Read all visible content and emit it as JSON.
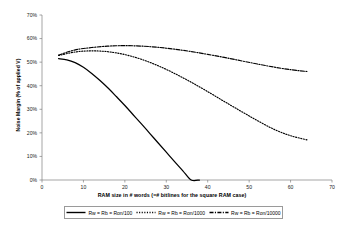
{
  "chart_data": {
    "type": "line",
    "title": "",
    "xlabel": "RAM size in # words (=# bitlines for the square RAM case)",
    "ylabel": "Noise Margin (% of applied V)",
    "xlim": [
      0,
      70
    ],
    "ylim": [
      0,
      70
    ],
    "xticks": [
      0,
      10,
      20,
      30,
      40,
      50,
      60,
      70
    ],
    "xtick_labels": [
      "0",
      "10",
      "20",
      "30",
      "40",
      "50",
      "60",
      "70"
    ],
    "yticks": [
      0,
      10,
      20,
      30,
      40,
      50,
      60,
      70
    ],
    "ytick_labels": [
      "0%",
      "10%",
      "20%",
      "30%",
      "40%",
      "50%",
      "60%",
      "70%"
    ],
    "grid": false,
    "legend_position": "bottom",
    "series": [
      {
        "name": "Rw = Rb = Ron/100",
        "style": "solid",
        "color": "#000000",
        "x": [
          4,
          6,
          8,
          10,
          12,
          14,
          16,
          18,
          20,
          22,
          24,
          26,
          28,
          30,
          32,
          34,
          36,
          38
        ],
        "y": [
          51.5,
          51.0,
          49.8,
          47.8,
          45.2,
          42.2,
          38.9,
          35.3,
          31.6,
          27.7,
          23.8,
          19.8,
          15.8,
          11.8,
          7.8,
          3.9,
          0.0,
          0.0
        ]
      },
      {
        "name": "Rw = Rb = Ron/1000",
        "style": "dotted",
        "color": "#000000",
        "x": [
          4,
          8,
          12,
          16,
          20,
          24,
          28,
          32,
          36,
          40,
          44,
          48,
          52,
          56,
          60,
          64
        ],
        "y": [
          52.8,
          54.3,
          54.8,
          54.4,
          53.2,
          51.2,
          48.5,
          45.2,
          41.5,
          37.5,
          33.3,
          29.2,
          25.2,
          21.5,
          18.8,
          17.0
        ]
      },
      {
        "name": "Rw = Rb = Ron/10000",
        "style": "dashdot",
        "color": "#000000",
        "x": [
          4,
          8,
          12,
          16,
          20,
          24,
          28,
          32,
          36,
          40,
          44,
          48,
          52,
          56,
          60,
          64
        ],
        "y": [
          53.0,
          55.2,
          56.2,
          56.8,
          57.0,
          56.8,
          56.3,
          55.5,
          54.5,
          53.3,
          52.0,
          50.6,
          49.2,
          47.9,
          46.8,
          46.0
        ]
      }
    ]
  },
  "axes": {
    "y_title": "Noise Margin (% of applied V)",
    "x_title": "RAM size in # words (=# bitlines for the square RAM case)",
    "y_labels": [
      "70%",
      "60%",
      "50%",
      "40%",
      "30%",
      "20%",
      "10%",
      "0%"
    ],
    "x_labels": [
      "0",
      "10",
      "20",
      "30",
      "40",
      "50",
      "60",
      "70"
    ]
  },
  "legend": {
    "items": [
      {
        "label": "Rw = Rb = Ron/100",
        "style": "solid"
      },
      {
        "label": "Rw = Rb = Ron/1000",
        "style": "dotted"
      },
      {
        "label": "Rw = Rb = Ron/10000",
        "style": "dashdot"
      }
    ]
  }
}
